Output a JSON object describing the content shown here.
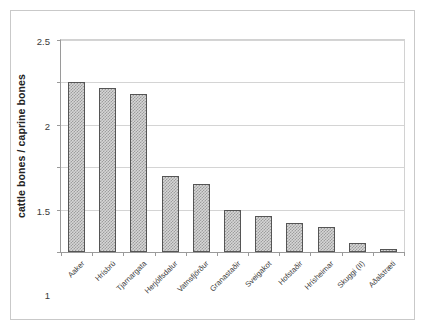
{
  "figure": {
    "frame_color": "#c9c9c9",
    "background": "#ffffff"
  },
  "chart_data": {
    "type": "bar",
    "title": "",
    "xlabel": "",
    "ylabel": "cattle bones / caprine bones",
    "ylim": [
      0,
      2.5
    ],
    "ytick_labels": [
      "0",
      "0.5",
      "1",
      "1.5",
      "2",
      "2.5"
    ],
    "ytick_values": [
      0,
      0.5,
      1,
      1.5,
      2,
      2.5
    ],
    "grid": true,
    "grid_axis": "y",
    "legend": false,
    "bar_fill_color": "#d6d6d6",
    "bar_pattern_color": "#9d9d9d",
    "bar_edge_color": "#555555",
    "categories": [
      "Aaker",
      "Hrísbrú",
      "Tjarnargata",
      "Herjólfsdalur",
      "Vatnsfjörður",
      "Granastaðir",
      "Sveigakot",
      "Hofstaðir",
      "Hrísheimar",
      "Skuggi (II)",
      "Aðalstræti"
    ],
    "values": [
      2.0,
      1.93,
      1.86,
      0.9,
      0.8,
      0.5,
      0.42,
      0.34,
      0.3,
      0.11,
      0.03
    ]
  }
}
